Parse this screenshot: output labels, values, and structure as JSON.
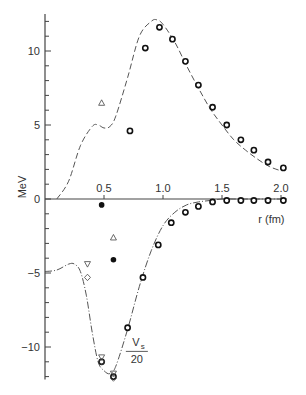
{
  "chart_data": {
    "type": "line",
    "title": "",
    "xlabel": "r (fm)",
    "ylabel": "MeV",
    "xlim": [
      0,
      2.05
    ],
    "ylim": [
      -12.2,
      12.5
    ],
    "xticks": [
      0.5,
      1.0,
      1.5,
      2.0
    ],
    "xtick_labels": [
      "0.5",
      "1.0",
      "1.5",
      "2.0"
    ],
    "yticks": [
      -10,
      -5,
      0,
      5,
      10
    ],
    "ytick_labels": [
      "−10",
      "−5",
      "0",
      "5",
      "10"
    ],
    "annotations": [
      {
        "text_num": "V",
        "text_sub": "s",
        "text_den": "20",
        "x": 0.77,
        "y": -10.5
      }
    ],
    "series": [
      {
        "name": "upper potential curve (dashed)",
        "style": "dashed",
        "x": [
          0.1,
          0.2,
          0.3,
          0.4,
          0.45,
          0.5,
          0.55,
          0.6,
          0.7,
          0.8,
          0.9,
          0.95,
          1.0,
          1.1,
          1.2,
          1.3,
          1.4,
          1.5,
          1.6,
          1.7,
          1.8,
          1.9,
          2.0
        ],
        "y": [
          0.0,
          1.2,
          3.6,
          4.9,
          5.0,
          4.8,
          4.9,
          5.6,
          8.2,
          11.0,
          12.0,
          12.1,
          11.8,
          10.6,
          9.0,
          7.5,
          6.1,
          5.0,
          4.0,
          3.3,
          2.7,
          2.2,
          1.9
        ]
      },
      {
        "name": "lower potential curve V_s/20 (dash-dot)",
        "style": "dashdot",
        "x": [
          0.0,
          0.1,
          0.2,
          0.25,
          0.3,
          0.35,
          0.4,
          0.45,
          0.5,
          0.55,
          0.6,
          0.7,
          0.8,
          0.9,
          1.0,
          1.1,
          1.2,
          1.3,
          1.4,
          1.5,
          1.6,
          1.7,
          1.8,
          1.9,
          2.0
        ],
        "y": [
          -4.9,
          -4.8,
          -4.4,
          -4.4,
          -4.9,
          -6.5,
          -9.0,
          -11.0,
          -11.6,
          -11.8,
          -11.3,
          -8.8,
          -5.9,
          -3.5,
          -1.8,
          -0.9,
          -0.4,
          -0.2,
          -0.1,
          0,
          0,
          0,
          0,
          0,
          0
        ]
      },
      {
        "name": "open circle points (upper)",
        "marker": "circle-open",
        "x": [
          0.72,
          0.85,
          0.97,
          1.08,
          1.19,
          1.3,
          1.42,
          1.54,
          1.66,
          1.77,
          1.89,
          2.02
        ],
        "y": [
          4.6,
          10.2,
          11.6,
          10.8,
          9.3,
          7.7,
          6.2,
          5.0,
          4.0,
          3.3,
          2.5,
          2.1
        ]
      },
      {
        "name": "open circle points (lower)",
        "marker": "circle-open",
        "x": [
          0.48,
          0.58,
          0.7,
          0.83,
          0.96,
          1.07,
          1.19,
          1.3,
          1.42,
          1.54,
          1.66,
          1.77,
          1.89,
          2.02
        ],
        "y": [
          -11.0,
          -12.0,
          -8.7,
          -5.3,
          -3.1,
          -1.6,
          -0.9,
          -0.5,
          -0.2,
          -0.1,
          -0.1,
          -0.1,
          -0.1,
          -0.1
        ]
      },
      {
        "name": "open triangle",
        "marker": "triangle-up-open",
        "x": [
          0.48,
          0.58
        ],
        "y": [
          6.5,
          -2.6
        ]
      },
      {
        "name": "filled circle",
        "marker": "circle-filled",
        "x": [
          0.48,
          0.58
        ],
        "y": [
          -0.4,
          -4.1
        ]
      },
      {
        "name": "inverted triangle",
        "marker": "triangle-down-open",
        "x": [
          0.36,
          0.48,
          0.58
        ],
        "y": [
          -4.4,
          -10.7,
          -11.8
        ]
      },
      {
        "name": "open diamond",
        "marker": "diamond-open",
        "x": [
          0.36,
          0.48,
          0.58
        ],
        "y": [
          -5.3,
          -11.0,
          -12.1
        ]
      }
    ]
  }
}
